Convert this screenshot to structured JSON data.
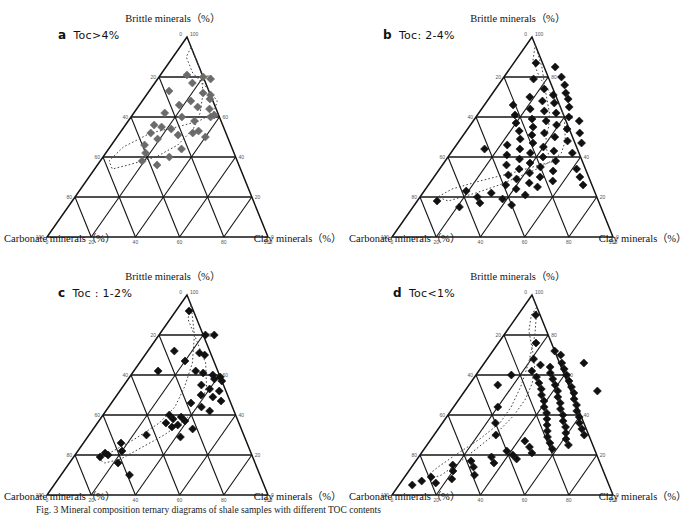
{
  "figure": {
    "caption_prefix": "Fig. 3",
    "caption_text": "Fig. 3  Mineral composition ternary diagrams of shale samples with different TOC contents"
  },
  "axes": {
    "top_label": "Brittle minerals（%）",
    "left_label": "Carbonate minerals（%）",
    "right_label": "Clay minerals（%）",
    "apex_left_tick": "0",
    "apex_right_tick": "100",
    "left_axis_ticks": [
      "20",
      "40",
      "60",
      "80",
      "100"
    ],
    "right_axis_ticks": [
      "80",
      "60",
      "40",
      "20",
      "0"
    ],
    "bottom_axis_ticks": [
      "0",
      "20",
      "40",
      "60",
      "80",
      "100"
    ]
  },
  "panels": [
    {
      "id": "a",
      "letter": "a",
      "label": "Toc>4%",
      "marker_color": "#6b6b6b",
      "marker_size": 7
    },
    {
      "id": "b",
      "letter": "b",
      "label": "Toc: 2-4%",
      "marker_color": "#111111",
      "marker_size": 7
    },
    {
      "id": "c",
      "letter": "c",
      "label": "Toc : 1-2%",
      "marker_color": "#111111",
      "marker_size": 7
    },
    {
      "id": "d",
      "letter": "d",
      "label": "Toc<1%",
      "marker_color": "#111111",
      "marker_size": 7
    }
  ],
  "chart_data": [
    {
      "type": "scatter",
      "panel": "a",
      "title": "Toc>4%",
      "axis_labels": {
        "top": "Brittle minerals（%）",
        "left": "Carbonate minerals（%）",
        "right": "Clay minerals（%）"
      },
      "axis_range": [
        0,
        100
      ],
      "grid": true,
      "marker": "diamond",
      "marker_color": "#6b6b6b",
      "points_brittle_clay_carbonate": [
        [
          81,
          12,
          7
        ],
        [
          80,
          20,
          0
        ],
        [
          79,
          24,
          -3
        ],
        [
          77,
          17,
          6
        ],
        [
          73,
          9,
          18
        ],
        [
          72,
          25,
          3
        ],
        [
          71,
          29,
          0
        ],
        [
          69,
          30,
          1
        ],
        [
          68,
          22,
          10
        ],
        [
          66,
          18,
          16
        ],
        [
          65,
          27,
          8
        ],
        [
          64,
          33,
          3
        ],
        [
          62,
          14,
          24
        ],
        [
          61,
          37,
          2
        ],
        [
          60,
          23,
          17
        ],
        [
          58,
          30,
          12
        ],
        [
          56,
          13,
          31
        ],
        [
          55,
          17,
          28
        ],
        [
          54,
          22,
          24
        ],
        [
          53,
          35,
          12
        ],
        [
          52,
          14,
          34
        ],
        [
          51,
          27,
          22
        ],
        [
          50,
          40,
          10
        ],
        [
          49,
          19,
          32
        ],
        [
          46,
          15,
          39
        ],
        [
          44,
          33,
          23
        ],
        [
          42,
          18,
          40
        ],
        [
          40,
          30,
          30
        ],
        [
          38,
          19,
          43
        ],
        [
          36,
          27,
          37
        ],
        [
          52,
          33,
          15
        ],
        [
          60,
          36,
          4
        ]
      ],
      "boundary_curve": "dotted envelope enclosing the favorable brittle-rich field"
    },
    {
      "type": "scatter",
      "panel": "b",
      "title": "Toc: 2-4%",
      "axis_labels": {
        "top": "Brittle minerals（%）",
        "left": "Carbonate minerals（%）",
        "right": "Clay minerals（%）"
      },
      "axis_range": [
        0,
        100
      ],
      "grid": true,
      "marker": "diamond",
      "marker_color": "#111111",
      "points_brittle_clay_carbonate": [
        [
          87,
          10,
          3
        ],
        [
          85,
          20,
          -5
        ],
        [
          80,
          26,
          -6
        ],
        [
          79,
          14,
          7
        ],
        [
          76,
          30,
          -6
        ],
        [
          74,
          22,
          4
        ],
        [
          72,
          33,
          -5
        ],
        [
          71,
          28,
          1
        ],
        [
          70,
          18,
          12
        ],
        [
          69,
          36,
          -5
        ],
        [
          68,
          25,
          7
        ],
        [
          67,
          31,
          2
        ],
        [
          66,
          13,
          21
        ],
        [
          65,
          39,
          -4
        ],
        [
          64,
          22,
          14
        ],
        [
          63,
          29,
          8
        ],
        [
          62,
          35,
          3
        ],
        [
          61,
          17,
          22
        ],
        [
          60,
          42,
          -2
        ],
        [
          59,
          26,
          15
        ],
        [
          58,
          33,
          9
        ],
        [
          57,
          20,
          23
        ],
        [
          56,
          39,
          5
        ],
        [
          55,
          29,
          16
        ],
        [
          54,
          45,
          1
        ],
        [
          53,
          24,
          23
        ],
        [
          52,
          36,
          12
        ],
        [
          51,
          31,
          18
        ],
        [
          50,
          42,
          8
        ],
        [
          49,
          27,
          24
        ],
        [
          48,
          49,
          3
        ],
        [
          47,
          34,
          19
        ],
        [
          46,
          23,
          31
        ],
        [
          45,
          40,
          15
        ],
        [
          44,
          30,
          26
        ],
        [
          43,
          46,
          11
        ],
        [
          42,
          36,
          22
        ],
        [
          41,
          26,
          33
        ],
        [
          40,
          43,
          17
        ],
        [
          39,
          33,
          28
        ],
        [
          38,
          50,
          12
        ],
        [
          37,
          39,
          24
        ],
        [
          36,
          29,
          35
        ],
        [
          35,
          45,
          20
        ],
        [
          34,
          36,
          30
        ],
        [
          33,
          52,
          15
        ],
        [
          32,
          42,
          26
        ],
        [
          31,
          33,
          36
        ],
        [
          30,
          48,
          22
        ],
        [
          29,
          38,
          33
        ],
        [
          28,
          55,
          17
        ],
        [
          27,
          45,
          28
        ],
        [
          26,
          35,
          39
        ],
        [
          25,
          50,
          25
        ],
        [
          24,
          41,
          35
        ],
        [
          23,
          19,
          58
        ],
        [
          22,
          31,
          47
        ],
        [
          21,
          47,
          32
        ],
        [
          20,
          26,
          54
        ],
        [
          19,
          38,
          43
        ],
        [
          18,
          9,
          73
        ],
        [
          17,
          29,
          54
        ],
        [
          16,
          44,
          40
        ],
        [
          15,
          21,
          64
        ],
        [
          42,
          55,
          3
        ],
        [
          47,
          56,
          -3
        ],
        [
          52,
          52,
          -4
        ],
        [
          58,
          48,
          -6
        ],
        [
          34,
          62,
          4
        ],
        [
          30,
          66,
          4
        ],
        [
          26,
          70,
          4
        ],
        [
          44,
          14,
          42
        ]
      ],
      "boundary_curve": "dotted envelope enclosing the favorable field"
    },
    {
      "type": "scatter",
      "panel": "c",
      "title": "Toc : 1-2%",
      "axis_labels": {
        "top": "Brittle minerals（%）",
        "left": "Carbonate minerals（%）",
        "right": "Clay minerals（%）"
      },
      "axis_range": [
        0,
        100
      ],
      "grid": true,
      "marker": "diamond",
      "marker_color": "#111111",
      "points_brittle_clay_carbonate": [
        [
          92,
          6,
          2
        ],
        [
          80,
          21,
          -1
        ],
        [
          80,
          25,
          -5
        ],
        [
          72,
          12,
          16
        ],
        [
          71,
          24,
          5
        ],
        [
          70,
          27,
          3
        ],
        [
          67,
          20,
          13
        ],
        [
          62,
          28,
          10
        ],
        [
          61,
          32,
          7
        ],
        [
          60,
          37,
          3
        ],
        [
          59,
          41,
          0
        ],
        [
          58,
          39,
          3
        ],
        [
          57,
          43,
          0
        ],
        [
          55,
          35,
          10
        ],
        [
          53,
          40,
          7
        ],
        [
          52,
          45,
          3
        ],
        [
          50,
          38,
          12
        ],
        [
          49,
          44,
          7
        ],
        [
          47,
          49,
          4
        ],
        [
          46,
          36,
          18
        ],
        [
          44,
          42,
          14
        ],
        [
          42,
          47,
          11
        ],
        [
          40,
          30,
          30
        ],
        [
          39,
          36,
          25
        ],
        [
          38,
          33,
          29
        ],
        [
          37,
          39,
          24
        ],
        [
          36,
          31,
          33
        ],
        [
          35,
          37,
          28
        ],
        [
          34,
          35,
          31
        ],
        [
          33,
          45,
          22
        ],
        [
          30,
          26,
          44
        ],
        [
          29,
          42,
          29
        ],
        [
          26,
          17,
          57
        ],
        [
          22,
          20,
          58
        ],
        [
          21,
          13,
          66
        ],
        [
          20,
          15,
          65
        ],
        [
          19,
          12,
          69
        ],
        [
          16,
          22,
          62
        ],
        [
          10,
          31,
          59
        ],
        [
          62,
          11,
          27
        ]
      ],
      "boundary_curve": "dotted envelope enclosing the favorable field"
    },
    {
      "type": "scatter",
      "panel": "d",
      "title": "Toc<1%",
      "axis_labels": {
        "top": "Brittle minerals（%）",
        "left": "Carbonate minerals（%）",
        "right": "Clay minerals（%）"
      },
      "axis_range": [
        0,
        100
      ],
      "grid": true,
      "marker": "diamond",
      "marker_color": "#111111",
      "points_brittle_clay_carbonate": [
        [
          90,
          8,
          2
        ],
        [
          76,
          17,
          7
        ],
        [
          72,
          28,
          0
        ],
        [
          70,
          32,
          -2
        ],
        [
          68,
          21,
          11
        ],
        [
          66,
          35,
          -1
        ],
        [
          65,
          26,
          9
        ],
        [
          64,
          31,
          5
        ],
        [
          63,
          38,
          -1
        ],
        [
          62,
          24,
          14
        ],
        [
          61,
          33,
          6
        ],
        [
          60,
          41,
          -1
        ],
        [
          59,
          28,
          13
        ],
        [
          58,
          36,
          6
        ],
        [
          57,
          44,
          -1
        ],
        [
          56,
          31,
          13
        ],
        [
          55,
          39,
          6
        ],
        [
          54,
          47,
          -1
        ],
        [
          53,
          34,
          13
        ],
        [
          52,
          42,
          6
        ],
        [
          51,
          50,
          -1
        ],
        [
          50,
          36,
          14
        ],
        [
          49,
          44,
          7
        ],
        [
          48,
          52,
          0
        ],
        [
          47,
          39,
          14
        ],
        [
          46,
          47,
          7
        ],
        [
          45,
          55,
          0
        ],
        [
          44,
          41,
          15
        ],
        [
          43,
          49,
          8
        ],
        [
          42,
          57,
          1
        ],
        [
          41,
          44,
          15
        ],
        [
          40,
          52,
          8
        ],
        [
          39,
          60,
          1
        ],
        [
          38,
          46,
          16
        ],
        [
          37,
          54,
          9
        ],
        [
          36,
          62,
          2
        ],
        [
          35,
          48,
          17
        ],
        [
          34,
          57,
          9
        ],
        [
          33,
          65,
          2
        ],
        [
          32,
          50,
          18
        ],
        [
          31,
          59,
          10
        ],
        [
          30,
          68,
          2
        ],
        [
          29,
          52,
          19
        ],
        [
          28,
          61,
          11
        ],
        [
          27,
          43,
          30
        ],
        [
          26,
          55,
          19
        ],
        [
          25,
          64,
          11
        ],
        [
          24,
          47,
          29
        ],
        [
          23,
          58,
          19
        ],
        [
          22,
          38,
          40
        ],
        [
          21,
          50,
          29
        ],
        [
          20,
          42,
          38
        ],
        [
          19,
          33,
          48
        ],
        [
          18,
          45,
          37
        ],
        [
          17,
          25,
          58
        ],
        [
          16,
          36,
          48
        ],
        [
          15,
          18,
          67
        ],
        [
          14,
          28,
          58
        ],
        [
          12,
          20,
          68
        ],
        [
          10,
          31,
          59
        ],
        [
          9,
          12,
          79
        ],
        [
          8,
          22,
          70
        ],
        [
          7,
          9,
          84
        ],
        [
          6,
          16,
          78
        ],
        [
          5,
          6,
          89
        ],
        [
          60,
          16,
          24
        ],
        [
          55,
          13,
          32
        ],
        [
          44,
          20,
          36
        ],
        [
          36,
          24,
          40
        ],
        [
          30,
          28,
          42
        ],
        [
          66,
          45,
          -11
        ],
        [
          52,
          60,
          -12
        ]
      ],
      "boundary_curve": "dotted envelope enclosing the favorable field"
    }
  ]
}
